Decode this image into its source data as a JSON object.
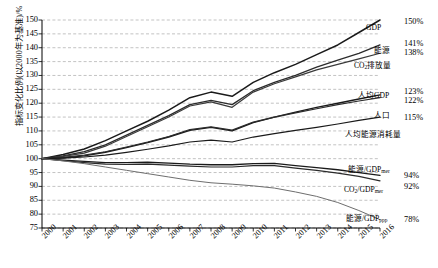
{
  "chart_data": {
    "type": "line",
    "title": "",
    "xlabel": "",
    "ylabel": "指标变化比例(以2000年为基准)/%",
    "x": [
      2000,
      2001,
      2002,
      2003,
      2004,
      2005,
      2006,
      2007,
      2008,
      2009,
      2010,
      2011,
      2012,
      2013,
      2014,
      2015,
      2016
    ],
    "xticklabels": [
      "2000",
      "2001",
      "2002",
      "2003",
      "2004",
      "2005",
      "2006",
      "2007",
      "2008",
      "2009",
      "2010",
      "2011",
      "2012",
      "2013",
      "2014",
      "2015",
      "2016"
    ],
    "ylim": [
      75,
      150
    ],
    "yticks": [
      75,
      80,
      85,
      90,
      95,
      100,
      105,
      110,
      115,
      120,
      125,
      130,
      135,
      140,
      145,
      150
    ],
    "grid": true,
    "legend": "inline-right-labels",
    "series": [
      {
        "name": "GDP",
        "label": "GDP",
        "end_label": "150%",
        "color": "#1a1a1a",
        "width": 1.5,
        "values": [
          100,
          101.5,
          103.5,
          106.5,
          110,
          113.5,
          117.5,
          122,
          124,
          122.5,
          127.5,
          131,
          134,
          137.5,
          141,
          145.5,
          150
        ]
      },
      {
        "name": "能源",
        "label": "能源",
        "end_label": "141%",
        "color": "#2b2b2b",
        "width": 1.3,
        "values": [
          100,
          101,
          102.5,
          105,
          108.5,
          112,
          115.5,
          119.5,
          121,
          119.5,
          124.5,
          127.5,
          130,
          133,
          135.5,
          138,
          141
        ]
      },
      {
        "name": "CO2排放量",
        "label": "CO₂排放量",
        "end_label": "138%",
        "color": "#3a3a3a",
        "width": 1.2,
        "values": [
          100,
          100.8,
          102,
          104.5,
          108,
          111.5,
          115,
          119,
          120.5,
          118.5,
          124,
          127,
          129.5,
          132,
          134,
          136,
          138
        ]
      },
      {
        "name": "人均GDP",
        "label": "人均GDP",
        "end_label": "123%",
        "color": "#1a1a1a",
        "width": 1.4,
        "values": [
          100,
          100.3,
          101,
          102.3,
          104,
          105.8,
          107.8,
          110.2,
          111.3,
          110,
          113,
          115,
          116.8,
          118.5,
          120,
          121.5,
          123
        ]
      },
      {
        "name": "人口",
        "label": "人口",
        "end_label": "122%",
        "color": "#2b2b2b",
        "width": 1.2,
        "values": [
          100,
          100.5,
          101.3,
          102.5,
          104.2,
          106,
          108,
          110.5,
          111.5,
          110.3,
          113.2,
          115,
          116.5,
          118,
          119.5,
          120.8,
          122
        ]
      },
      {
        "name": "人均能源消耗量",
        "label": "人均能源消耗量",
        "end_label": "115%",
        "color": "#1a1a1a",
        "width": 1.2,
        "values": [
          100,
          100.2,
          100.6,
          101.3,
          102.3,
          103.4,
          104.6,
          106,
          106.7,
          106,
          107.8,
          109,
          110.2,
          111.3,
          112.5,
          113.8,
          115
        ]
      },
      {
        "name": "能源/GDPmer",
        "label": "能源/GDP",
        "label_sub": "mer",
        "end_label": "94%",
        "color": "#1a1a1a",
        "width": 1.3,
        "values": [
          100,
          99.5,
          99,
          98.6,
          98.6,
          98.7,
          98.4,
          98,
          97.8,
          97.8,
          98.2,
          98.3,
          97.5,
          96.8,
          96,
          95,
          94
        ]
      },
      {
        "name": "CO2/GDPmer",
        "label": "CO₂/GDP",
        "label_sub": "mer",
        "end_label": "92%",
        "color": "#2b2b2b",
        "width": 1.2,
        "values": [
          100,
          99.3,
          98.6,
          98,
          97.9,
          98,
          97.7,
          97.3,
          97,
          97,
          97.5,
          97.5,
          96.6,
          95.8,
          94.8,
          93.6,
          92
        ]
      },
      {
        "name": "能源/GDPppp",
        "label": "能源/GDP",
        "label_sub": "ppp",
        "end_label": "78%",
        "color": "#6e6e6e",
        "width": 1.0,
        "values": [
          100,
          99.2,
          98.2,
          97,
          95.8,
          94.6,
          93.4,
          92.2,
          91.3,
          90.8,
          90.2,
          89.4,
          88,
          86.4,
          84.2,
          81.3,
          78
        ]
      }
    ],
    "annotations": [
      {
        "text": "GDP",
        "x": 366,
        "y": 24
      },
      {
        "text": "能源",
        "x": 374,
        "y": 47
      },
      {
        "text": "CO₂排放量",
        "x": 354,
        "y": 62
      },
      {
        "text": "人均GDP",
        "x": 358,
        "y": 92
      },
      {
        "text": "人口",
        "x": 374,
        "y": 112
      },
      {
        "text": "人均能源消耗量",
        "x": 345,
        "y": 131
      },
      {
        "text": "能源/GDPmer",
        "x": 348,
        "y": 166
      },
      {
        "text": "CO₂/GDPmer",
        "x": 344,
        "y": 186
      },
      {
        "text": "能源/GDPppp",
        "x": 346,
        "y": 215
      }
    ],
    "value_labels": [
      {
        "text": "150%",
        "y": 18
      },
      {
        "text": "141%",
        "y": 40
      },
      {
        "text": "138%",
        "y": 49
      },
      {
        "text": "123%",
        "y": 88
      },
      {
        "text": "122%",
        "y": 97
      },
      {
        "text": "115%",
        "y": 114
      },
      {
        "text": "94%",
        "y": 172
      },
      {
        "text": "92%",
        "y": 183
      },
      {
        "text": "78%",
        "y": 216
      }
    ]
  }
}
